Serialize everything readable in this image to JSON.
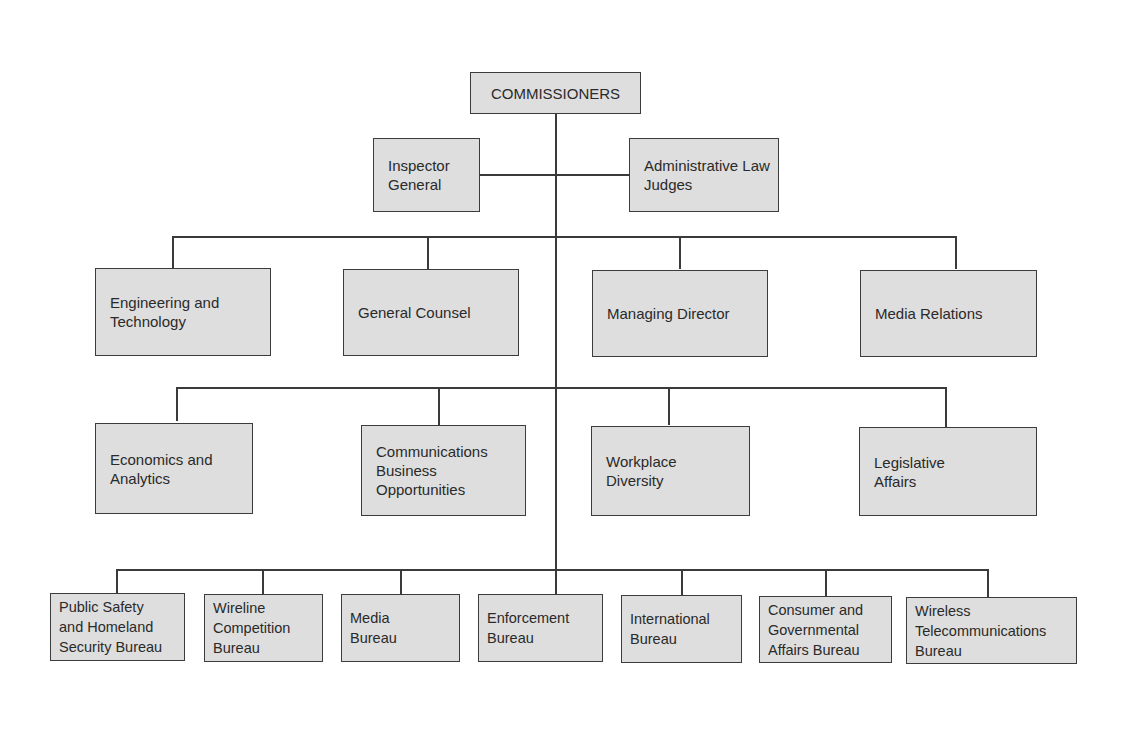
{
  "chart": {
    "top": {
      "label": "COMMISSIONERS"
    },
    "staff": [
      {
        "label": "Inspector\nGeneral"
      },
      {
        "label": "Administrative Law\nJudges"
      }
    ],
    "offices_row1": [
      {
        "label": "Engineering and\nTechnology"
      },
      {
        "label": "General Counsel"
      },
      {
        "label": "Managing Director"
      },
      {
        "label": "Media Relations"
      }
    ],
    "offices_row2": [
      {
        "label": "Economics and\nAnalytics"
      },
      {
        "label": "Communications\nBusiness\nOpportunities"
      },
      {
        "label": "Workplace\nDiversity"
      },
      {
        "label": "Legislative\nAffairs"
      }
    ],
    "bureaus": [
      {
        "label": "Public Safety\nand Homeland\nSecurity Bureau"
      },
      {
        "label": "Wireline\nCompetition\nBureau"
      },
      {
        "label": "Media\nBureau"
      },
      {
        "label": "Enforcement\nBureau"
      },
      {
        "label": "International\nBureau"
      },
      {
        "label": "Consumer and\nGovernmental\nAffairs Bureau"
      },
      {
        "label": "Wireless\nTelecommunications\nBureau"
      }
    ]
  },
  "colors": {
    "box_fill": "#dedede",
    "line": "#3a3a3a",
    "text": "#2a2a2a"
  }
}
